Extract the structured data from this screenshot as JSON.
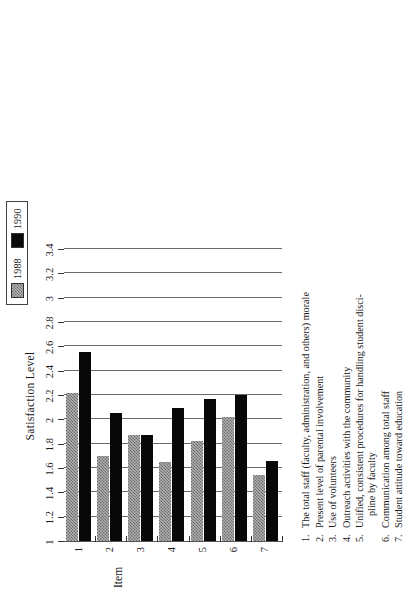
{
  "legend": {
    "entries": [
      {
        "label": "1988",
        "swatch": "hatched-gray-swatch",
        "color": "#b0b0b0"
      },
      {
        "label": "1990",
        "swatch": "solid-black-swatch",
        "color": "#080808"
      }
    ]
  },
  "value_axis": {
    "title": "Satisfaction Level",
    "ticks": [
      "1",
      "1.2",
      "1.4",
      "1.6",
      "1.8",
      "2",
      "2.2",
      "2.4",
      "2.6",
      "2.8",
      "3",
      "3.2",
      "3.4"
    ]
  },
  "category_axis": {
    "title": "Item",
    "ticks": [
      "1",
      "2",
      "3",
      "4",
      "5",
      "6",
      "7"
    ]
  },
  "items": [
    {
      "num": "1.",
      "text": "The total staff (faculty, administration, and others) morale",
      "cont": ""
    },
    {
      "num": "2.",
      "text": "Present level of parental involvement",
      "cont": ""
    },
    {
      "num": "3.",
      "text": "Use of volunteers",
      "cont": ""
    },
    {
      "num": "4.",
      "text": "Outreach activities with the community",
      "cont": ""
    },
    {
      "num": "5.",
      "text": "Unified, consistent procedures for handling student disci-",
      "cont": "pline by faculty"
    },
    {
      "num": "6.",
      "text": "Communication among total staff",
      "cont": ""
    },
    {
      "num": "7.",
      "text": "Student attitude toward education",
      "cont": ""
    }
  ],
  "chart_data": {
    "type": "bar",
    "title": "",
    "orientation": "rotated-vertical",
    "xlabel": "Item",
    "ylabel": "Satisfaction Level",
    "ylim": [
      1,
      3.4
    ],
    "grid": true,
    "legend_position": "top-left",
    "categories": [
      "1",
      "2",
      "3",
      "4",
      "5",
      "6",
      "7"
    ],
    "series": [
      {
        "name": "1988",
        "color": "#b0b0b0",
        "values": [
          2.22,
          1.7,
          1.87,
          1.65,
          1.82,
          2.02,
          1.54
        ]
      },
      {
        "name": "1990",
        "color": "#080808",
        "values": [
          2.55,
          2.05,
          1.87,
          2.09,
          2.17,
          2.2,
          1.66
        ]
      }
    ]
  }
}
